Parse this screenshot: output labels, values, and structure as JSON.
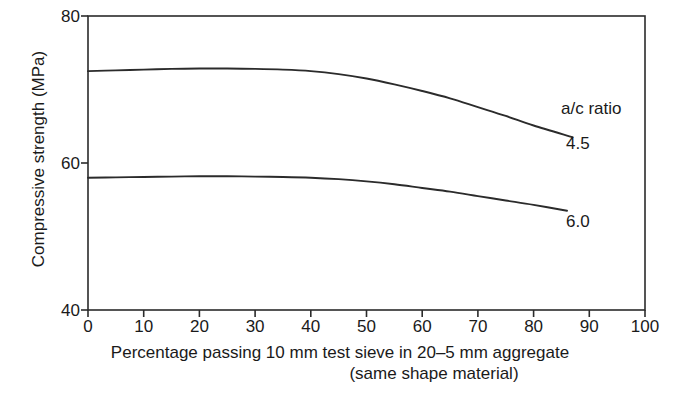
{
  "chart_data": {
    "type": "line",
    "title": "",
    "xlabel": "Percentage passing 10 mm test sieve in 20–5 mm aggregate (same shape material)",
    "xlabel_line1": "Percentage passing 10 mm test sieve in 20–5 mm aggregate",
    "xlabel_line2": "(same shape material)",
    "ylabel": "Compressive strength (MPa)",
    "xlim": [
      0,
      100
    ],
    "ylim": [
      40,
      80
    ],
    "xticks": [
      "0",
      "10",
      "20",
      "30",
      "40",
      "50",
      "60",
      "70",
      "80",
      "90",
      "100"
    ],
    "xtick_values": [
      0,
      10,
      20,
      30,
      40,
      50,
      60,
      70,
      80,
      90,
      100
    ],
    "yticks": [
      "80",
      "60",
      "40"
    ],
    "ytick_values": [
      80,
      60,
      40
    ],
    "grid": false,
    "legend_position": "inline-right",
    "legend_title": "a/c ratio",
    "line_color": "#2b2b2b",
    "axis_color": "#2b2b2b",
    "background": "#ffffff",
    "series": [
      {
        "name": "4.5",
        "label": "4.5",
        "x": [
          0,
          5,
          10,
          15,
          20,
          25,
          30,
          35,
          40,
          45,
          50,
          55,
          60,
          65,
          70,
          75,
          80,
          87
        ],
        "values": [
          72.5,
          72.6,
          72.7,
          72.8,
          72.85,
          72.85,
          72.8,
          72.7,
          72.5,
          72.1,
          71.5,
          70.7,
          69.8,
          68.8,
          67.6,
          66.4,
          65.1,
          63.5
        ]
      },
      {
        "name": "6.0",
        "label": "6.0",
        "x": [
          0,
          5,
          10,
          15,
          20,
          25,
          30,
          35,
          40,
          45,
          50,
          55,
          60,
          65,
          70,
          75,
          80,
          86
        ],
        "values": [
          58.0,
          58.05,
          58.1,
          58.15,
          58.2,
          58.2,
          58.15,
          58.1,
          58.0,
          57.8,
          57.5,
          57.1,
          56.6,
          56.1,
          55.5,
          54.9,
          54.3,
          53.5
        ]
      }
    ]
  },
  "annotations": {
    "legend_title": "a/c ratio",
    "series_45": "4.5",
    "series_60": "6.0"
  },
  "caption": {
    "text": ""
  }
}
